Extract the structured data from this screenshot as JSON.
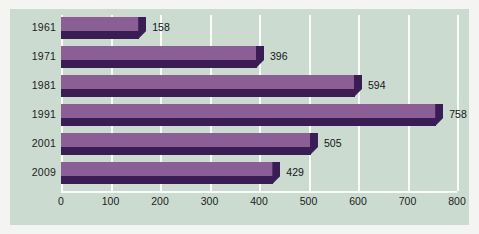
{
  "chart_data": {
    "type": "bar",
    "orientation": "horizontal",
    "title": "",
    "subtitle": "",
    "xlabel": "",
    "ylabel": "",
    "categories": [
      "1961",
      "1971",
      "1981",
      "1991",
      "2001",
      "2009"
    ],
    "values": [
      158,
      396,
      594,
      758,
      505,
      429
    ],
    "data_labels": [
      "158",
      "396",
      "594",
      "758",
      "505",
      "429"
    ],
    "xlim": [
      0,
      800
    ],
    "xticks": [
      0,
      100,
      200,
      300,
      400,
      500,
      600,
      700,
      800
    ],
    "xtick_labels": [
      "0",
      "100",
      "200",
      "300",
      "400",
      "500",
      "600",
      "700",
      "800"
    ],
    "grid": "vertical",
    "legend": "none",
    "series": [
      {
        "name": "",
        "values": [
          158,
          396,
          594,
          758,
          505,
          429
        ]
      }
    ],
    "style": "3d-extruded-bars",
    "colors": {
      "panel_background": "#cbdbd0",
      "page_background": "#f4f5f2",
      "bar_face": "#8b5e95",
      "bar_shadow": "#3b1d55",
      "gridline": "#fafcfa",
      "text": "#1c1c20"
    }
  }
}
